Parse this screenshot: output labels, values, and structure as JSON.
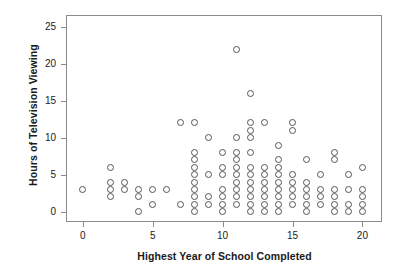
{
  "chart_data": {
    "type": "scatter",
    "title": "",
    "xlabel": "Highest Year of School Completed",
    "ylabel": "Hours of Television Viewing",
    "xlim": [
      -1.2,
      21.4
    ],
    "ylim": [
      -1.4,
      26.6
    ],
    "xticks": [
      0,
      5,
      10,
      15,
      20
    ],
    "yticks": [
      0,
      5,
      10,
      15,
      20,
      25
    ],
    "grid": false,
    "legend": null,
    "marker": "open-circle",
    "marker_color": "#555555",
    "frame_color": "#8a8a8a",
    "background": "#ffffff",
    "points": [
      [
        0,
        3
      ],
      [
        2,
        6
      ],
      [
        2,
        4
      ],
      [
        2,
        3
      ],
      [
        2,
        2
      ],
      [
        3,
        4
      ],
      [
        3,
        3
      ],
      [
        4,
        3
      ],
      [
        4,
        2
      ],
      [
        4,
        0
      ],
      [
        5,
        3
      ],
      [
        5,
        1
      ],
      [
        6,
        3
      ],
      [
        7,
        12
      ],
      [
        7,
        1
      ],
      [
        8,
        12
      ],
      [
        8,
        8
      ],
      [
        8,
        7
      ],
      [
        8,
        6
      ],
      [
        8,
        5
      ],
      [
        8,
        4
      ],
      [
        8,
        3
      ],
      [
        8,
        2
      ],
      [
        8,
        1
      ],
      [
        8,
        0
      ],
      [
        9,
        10
      ],
      [
        9,
        5
      ],
      [
        9,
        2
      ],
      [
        9,
        1
      ],
      [
        10,
        8
      ],
      [
        10,
        6
      ],
      [
        10,
        5
      ],
      [
        10,
        3
      ],
      [
        10,
        2
      ],
      [
        10,
        1
      ],
      [
        10,
        0
      ],
      [
        11,
        22
      ],
      [
        11,
        10
      ],
      [
        11,
        8
      ],
      [
        11,
        7
      ],
      [
        11,
        6
      ],
      [
        11,
        5
      ],
      [
        11,
        4
      ],
      [
        11,
        3
      ],
      [
        11,
        2
      ],
      [
        11,
        1
      ],
      [
        12,
        16
      ],
      [
        12,
        12
      ],
      [
        12,
        11
      ],
      [
        12,
        10
      ],
      [
        12,
        8
      ],
      [
        12,
        6
      ],
      [
        12,
        5
      ],
      [
        12,
        4
      ],
      [
        12,
        3
      ],
      [
        12,
        2
      ],
      [
        12,
        1
      ],
      [
        12,
        0
      ],
      [
        13,
        12
      ],
      [
        13,
        6
      ],
      [
        13,
        5
      ],
      [
        13,
        4
      ],
      [
        13,
        3
      ],
      [
        13,
        2
      ],
      [
        13,
        1
      ],
      [
        13,
        0
      ],
      [
        14,
        9
      ],
      [
        14,
        7
      ],
      [
        14,
        6
      ],
      [
        14,
        5
      ],
      [
        14,
        4
      ],
      [
        14,
        3
      ],
      [
        14,
        2
      ],
      [
        14,
        1
      ],
      [
        14,
        0
      ],
      [
        15,
        12
      ],
      [
        15,
        11
      ],
      [
        15,
        5
      ],
      [
        15,
        4
      ],
      [
        15,
        3
      ],
      [
        15,
        2
      ],
      [
        15,
        1
      ],
      [
        16,
        7
      ],
      [
        16,
        4
      ],
      [
        16,
        3
      ],
      [
        16,
        2
      ],
      [
        16,
        1
      ],
      [
        16,
        0
      ],
      [
        17,
        5
      ],
      [
        17,
        3
      ],
      [
        17,
        2
      ],
      [
        17,
        1
      ],
      [
        18,
        8
      ],
      [
        18,
        7
      ],
      [
        18,
        3
      ],
      [
        18,
        2
      ],
      [
        18,
        1
      ],
      [
        18,
        0
      ],
      [
        19,
        5
      ],
      [
        19,
        3
      ],
      [
        19,
        1
      ],
      [
        19,
        0
      ],
      [
        20,
        6
      ],
      [
        20,
        3
      ],
      [
        20,
        2
      ],
      [
        20,
        1
      ],
      [
        20,
        0
      ]
    ]
  }
}
